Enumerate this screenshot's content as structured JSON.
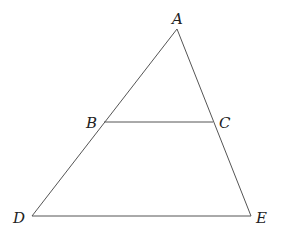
{
  "diagram": {
    "type": "triangle with parallel segment",
    "points": {
      "A": {
        "label": "A",
        "x": 177,
        "y": 29
      },
      "B": {
        "label": "B",
        "x": 104,
        "y": 122
      },
      "C": {
        "label": "C",
        "x": 213,
        "y": 122
      },
      "D": {
        "label": "D",
        "x": 32,
        "y": 216
      },
      "E": {
        "label": "E",
        "x": 251,
        "y": 216
      }
    },
    "segments": [
      [
        "A",
        "D"
      ],
      [
        "A",
        "E"
      ],
      [
        "D",
        "E"
      ],
      [
        "B",
        "C"
      ]
    ],
    "labels": {
      "A": "A",
      "B": "B",
      "C": "C",
      "D": "D",
      "E": "E"
    }
  }
}
